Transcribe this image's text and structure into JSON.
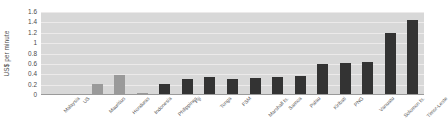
{
  "chart_data": {
    "type": "bar",
    "title": "",
    "xlabel": "",
    "ylabel": "US$ per minute",
    "ylim": [
      0,
      1.6
    ],
    "ytick_labels": [
      "1.6",
      "1.4",
      "1.2",
      "1",
      "0.8",
      "0.6",
      "0.4",
      "0.2",
      "0"
    ],
    "ytick_values": [
      1.6,
      1.4,
      1.2,
      1.0,
      0.8,
      0.6,
      0.4,
      0.2,
      0
    ],
    "grid": true,
    "legend": "none",
    "categories": [
      "Malaysia",
      "US",
      "Mauritius",
      "Honduras",
      "Indonesia",
      "Philippines",
      "Fiji",
      "Tonga",
      "FSM",
      "Marshall Is.",
      "Samoa",
      "Palau",
      "Kiribati",
      "PNG",
      "Vanuatu",
      "Solomon Is.",
      "Timor-Leste"
    ],
    "values": [
      0.02,
      0.02,
      0.21,
      0.38,
      0.04,
      0.21,
      0.31,
      0.34,
      0.31,
      0.33,
      0.34,
      0.37,
      0.6,
      0.62,
      0.63,
      1.2,
      1.44
    ],
    "bar_colors": [
      "#9a9a9a",
      "#9a9a9a",
      "#9a9a9a",
      "#9a9a9a",
      "#9a9a9a",
      "#333333",
      "#333333",
      "#333333",
      "#333333",
      "#333333",
      "#333333",
      "#333333",
      "#333333",
      "#333333",
      "#333333",
      "#333333",
      "#333333"
    ]
  },
  "style": {
    "plot_background": "#d8d8d8",
    "gridline_color": "#eceaea",
    "axis_color": "#9a9a9a",
    "text_color": "#4a4a4a",
    "comparator_bar_color": "#9a9a9a",
    "pacific_bar_color": "#333333"
  }
}
